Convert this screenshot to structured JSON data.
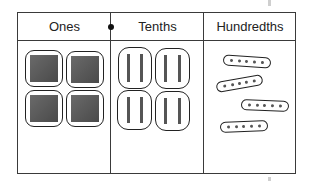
{
  "place_value_chart": {
    "columns": [
      {
        "label": "Ones",
        "blocks": 4,
        "block_type": "one-square"
      },
      {
        "label": "Tenths",
        "blocks": 4,
        "block_type": "tenth-rod-pair"
      },
      {
        "label": "Hundredths",
        "blocks": 4,
        "block_type": "hundredth-dot-group"
      }
    ],
    "decimal_point_position": "between Ones and Tenths",
    "dots_per_hundredths_group": 5,
    "rods_per_tenths_group": 2
  },
  "colors": {
    "line": "#3a3a3a",
    "block_fill": "#5a5a5a",
    "background": "#ffffff"
  }
}
